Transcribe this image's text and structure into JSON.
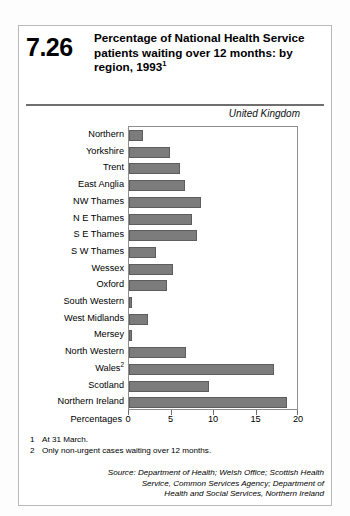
{
  "figure": {
    "number": "7.26",
    "title_line1": "Percentage of National Health Service",
    "title_line2": "patients waiting over 12 months: by",
    "title_line3": "region, 1993",
    "title_superscript": "1",
    "region_note": "United Kingdom"
  },
  "footnotes": [
    {
      "marker": "1",
      "text": "At 31 March."
    },
    {
      "marker": "2",
      "text": "Only non-urgent cases waiting over 12 months."
    }
  ],
  "source": {
    "line1": "Source: Department of Health; Welsh Office; Scottish Health",
    "line2": "Service, Common Services Agency; Department of",
    "line3": "Health and Social Services, Northern Ireland"
  },
  "chart_data": {
    "type": "bar",
    "orientation": "horizontal",
    "title": "Percentage of National Health Service patients waiting over 12 months: by region, 1993",
    "subtitle": "United Kingdom",
    "xlabel": "Percentages",
    "ylabel": "",
    "xlim": [
      0,
      20
    ],
    "xticks": [
      0,
      5,
      10,
      15,
      20
    ],
    "xtick_labels": [
      "0",
      "5",
      "10",
      "15",
      "20"
    ],
    "grid": false,
    "legend": false,
    "bar_color": "#7c7c7c",
    "categories": [
      "Northern",
      "Yorkshire",
      "Trent",
      "East Anglia",
      "NW Thames",
      "N E Thames",
      "S E Thames",
      "S W Thames",
      "Wessex",
      "Oxford",
      "South Western",
      "West Midlands",
      "Mersey",
      "North Western",
      "Wales",
      "Scotland",
      "Northern Ireland"
    ],
    "category_labels": [
      "Northern",
      "Yorkshire",
      "Trent",
      "East Anglia",
      "NW Thames",
      "N E Thames",
      "S E Thames",
      "S W Thames",
      "Wessex",
      "Oxford",
      "South Western",
      "West Midlands",
      "Mersey",
      "North Western",
      "Wales²",
      "Scotland",
      "Northern Ireland"
    ],
    "values": [
      1.7,
      4.8,
      6.0,
      6.6,
      8.5,
      7.4,
      8.0,
      3.2,
      5.2,
      4.5,
      0.4,
      2.2,
      0.3,
      6.7,
      17.0,
      9.4,
      18.6
    ]
  }
}
